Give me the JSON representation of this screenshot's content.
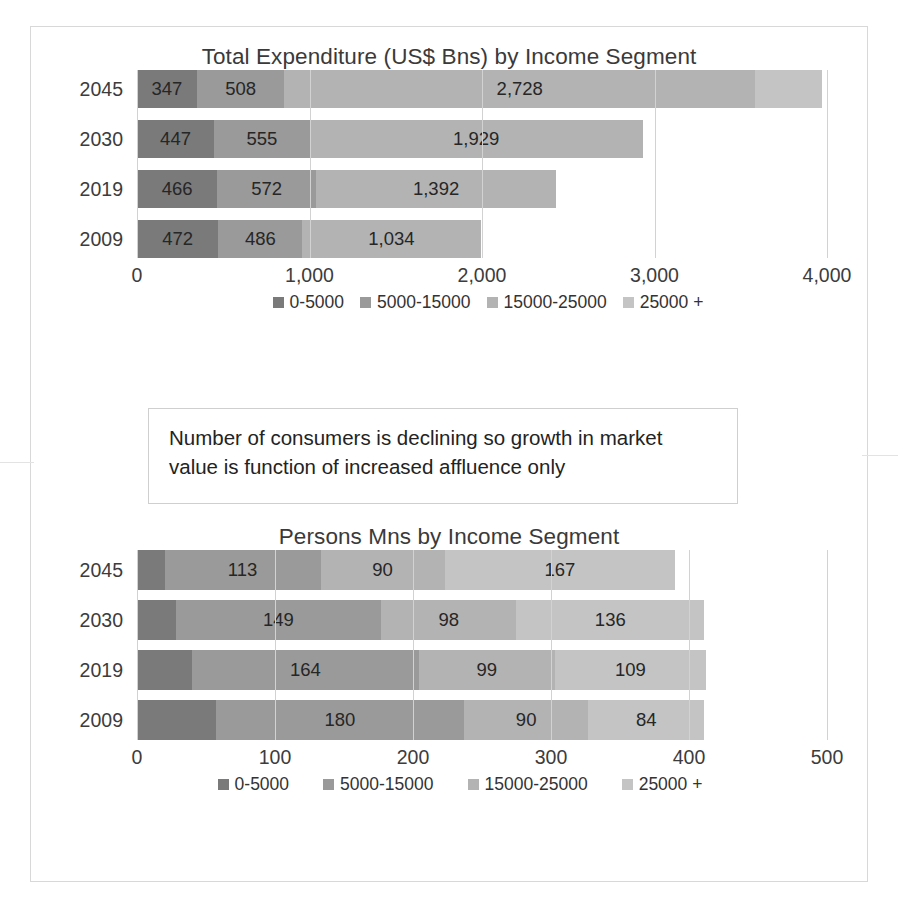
{
  "colors": {
    "seg1": "#7a7a7a",
    "seg2": "#9a9a9a",
    "seg3": "#b3b3b3",
    "seg4": "#c4c4c4",
    "gridline": "#d2d2d2",
    "frame": "#d8d8d8",
    "text": "#2b2b2b"
  },
  "callout": {
    "line1": "Number of consumers is declining so growth in market",
    "line2": "value is function  of  increased affluence only"
  },
  "legend_labels": [
    "0-5000",
    "5000-15000",
    "15000-25000",
    "25000 +"
  ],
  "chart_data": [
    {
      "type": "bar",
      "orientation": "horizontal",
      "stacked": true,
      "title": "Total Expenditure (US$ Bns) by Income Segment",
      "xlabel": "",
      "ylabel": "",
      "categories": [
        "2045",
        "2030",
        "2019",
        "2009"
      ],
      "xlim": [
        0,
        4000
      ],
      "xticks": [
        0,
        1000,
        2000,
        3000,
        4000
      ],
      "xticklabels": [
        "0",
        "1,000",
        "2,000",
        "3,000",
        "4,000"
      ],
      "grid": true,
      "legend_position": "bottom",
      "series": [
        {
          "name": "0-5000",
          "values": [
            347,
            447,
            466,
            472
          ],
          "labels": [
            "347",
            "447",
            "466",
            "472"
          ]
        },
        {
          "name": "5000-15000",
          "values": [
            508,
            555,
            572,
            486
          ],
          "labels": [
            "508",
            "555",
            "572",
            "486"
          ]
        },
        {
          "name": "15000-25000",
          "values": [
            2728,
            1929,
            1392,
            1034
          ],
          "labels": [
            "2,728",
            "1,929",
            "1,392",
            "1,034"
          ]
        },
        {
          "name": "25000 +",
          "values": [
            390,
            0,
            0,
            0
          ],
          "labels": [
            "",
            "",
            "",
            ""
          ]
        }
      ],
      "totals": [
        3973,
        2931,
        2430,
        1992
      ]
    },
    {
      "type": "bar",
      "orientation": "horizontal",
      "stacked": true,
      "title": "Persons Mns by Income Segment",
      "xlabel": "",
      "ylabel": "",
      "categories": [
        "2045",
        "2030",
        "2019",
        "2009"
      ],
      "xlim": [
        0,
        500
      ],
      "xticks": [
        0,
        100,
        200,
        300,
        400,
        500
      ],
      "xticklabels": [
        "0",
        "100",
        "200",
        "300",
        "400",
        "500"
      ],
      "grid": true,
      "legend_position": "bottom",
      "series": [
        {
          "name": "0-5000",
          "values": [
            20,
            28,
            40,
            57
          ],
          "labels": [
            "",
            "",
            "",
            ""
          ]
        },
        {
          "name": "5000-15000",
          "values": [
            113,
            149,
            164,
            180
          ],
          "labels": [
            "113",
            "149",
            "164",
            "180"
          ]
        },
        {
          "name": "15000-25000",
          "values": [
            90,
            98,
            99,
            90
          ],
          "labels": [
            "90",
            "98",
            "99",
            "90"
          ]
        },
        {
          "name": "25000 +",
          "values": [
            167,
            136,
            109,
            84
          ],
          "labels": [
            "167",
            "136",
            "109",
            "84"
          ]
        }
      ],
      "totals": [
        390,
        411,
        412,
        411
      ]
    }
  ]
}
